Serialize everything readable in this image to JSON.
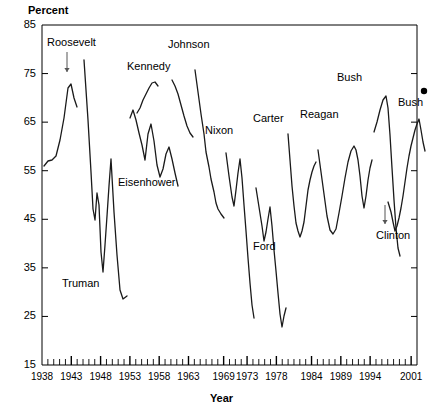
{
  "chart_data": {
    "type": "line",
    "title": "",
    "xlabel": "Year",
    "ylabel": "Percent",
    "ylim": [
      15,
      85
    ],
    "xlim": [
      1938,
      2002
    ],
    "grid": false,
    "legend": "none",
    "ytick_labels": [
      "15",
      "25",
      "35",
      "45",
      "55",
      "65",
      "75",
      "85"
    ],
    "ytick_values": [
      15,
      25,
      35,
      45,
      55,
      65,
      75,
      85
    ],
    "xtick_labels": [
      "1938",
      "1943",
      "1948",
      "1953",
      "1958",
      "1963",
      "1969",
      "1973",
      "1978",
      "1984",
      "1989",
      "1994",
      "2001"
    ],
    "xtick_values": [
      1938,
      1943,
      1948,
      1953,
      1958,
      1963,
      1969,
      1973,
      1978,
      1984,
      1989,
      1994,
      2001
    ],
    "minor_ticks": "annual",
    "annotations": [
      {
        "name": "Roosevelt",
        "label": "Roosevelt",
        "x_px": 47,
        "y_px": 36,
        "arrow": true,
        "arrow_x_px": 67,
        "arrow_y_top_px": 52,
        "arrow_y_bottom_px": 72
      },
      {
        "name": "Truman",
        "label": "Truman",
        "x_px": 62,
        "y_px": 277,
        "arrow": false
      },
      {
        "name": "Eisenhower",
        "label": "Eisenhower",
        "x_px": 118,
        "y_px": 176,
        "arrow": false
      },
      {
        "name": "Kennedy",
        "label": "Kennedy",
        "x_px": 127,
        "y_px": 60,
        "arrow": false
      },
      {
        "name": "Johnson",
        "label": "Johnson",
        "x_px": 168,
        "y_px": 38,
        "arrow": false
      },
      {
        "name": "Nixon",
        "label": "Nixon",
        "x_px": 205,
        "y_px": 124,
        "arrow": false
      },
      {
        "name": "Carter",
        "label": "Carter",
        "x_px": 253,
        "y_px": 112,
        "arrow": false
      },
      {
        "name": "Ford",
        "label": "Ford",
        "x_px": 253,
        "y_px": 240,
        "arrow": false
      },
      {
        "name": "Reagan",
        "label": "Reagan",
        "x_px": 300,
        "y_px": 108,
        "arrow": false
      },
      {
        "name": "Bush-41",
        "label": "Bush",
        "x_px": 337,
        "y_px": 71,
        "arrow": false
      },
      {
        "name": "Clinton",
        "label": "Clinton",
        "x_px": 376,
        "y_px": 229,
        "arrow": true,
        "arrow_x_px": 385,
        "arrow_y_top_px": 205,
        "arrow_y_bottom_px": 224
      },
      {
        "name": "Bush-43",
        "label": "Bush",
        "x_px": 398,
        "y_px": 96,
        "arrow": false
      }
    ],
    "end_marker": {
      "name": "bush-43-point",
      "x_px": 424,
      "y_px": 91,
      "value": 86,
      "year": 2001
    },
    "series": [
      {
        "name": "Roosevelt",
        "points_px": "44,166 48,161 52,160 56,156 60,140 64,118 68,88 71,84 74,98 77,107"
      },
      {
        "name": "Truman",
        "points_px": "84,60 88,120 91,172 93,209 95,220 97,193 99,205 101,252 103,272 105,245 107,216 109,186 111,159 114,212 117,255 120,290 123,299 127,296"
      },
      {
        "name": "Eisenhower",
        "points_px": "130,118 133,110 136,120 139,133 142,145 145,160 148,134 151,124 154,141 157,165 160,177 163,169 166,154 169,147 172,159 175,173 178,186"
      },
      {
        "name": "Kennedy",
        "points_px": "137,113 140,108 143,100 146,94 149,88 152,83 155,82 158,86"
      },
      {
        "name": "Johnson",
        "points_px": "172,80 175,86 178,94 181,105 184,116 187,126 190,133 193,137"
      },
      {
        "name": "Nixon",
        "points_px": "195,70 198,92 201,114 204,134 206,152 209,167 211,179 214,192 216,203 218,209 221,214 224,218"
      },
      {
        "name": "Nixon-2",
        "points_px": "226,153 229,176 232,197 234,206 236,190 238,173 240,159 242,178 244,205 246,231 248,258 250,283 252,305 254,318"
      },
      {
        "name": "Ford",
        "points_px": "256,188 259,207 262,226 264,241 266,232 268,219 270,207 272,226 274,250 276,271 278,293 280,314 282,327 284,316 286,308"
      },
      {
        "name": "Carter",
        "points_px": "288,134 290,160 292,186 294,206 296,223 298,231 300,237 302,231 304,222 306,206 308,190 310,180 312,172 314,166 316,162"
      },
      {
        "name": "Reagan",
        "points_px": "318,150 321,172 324,194 327,216 330,230 333,234 336,229 339,213 342,196 345,178 348,162 351,151 354,146 356,150 358,160 360,176 362,196 364,208 366,196 368,180 370,168 372,160"
      },
      {
        "name": "Bush-41",
        "points_px": "374,132 377,122 380,110 383,100 386,96 388,108 390,135 392,168 394,200 396,228 398,248 400,256"
      },
      {
        "name": "Clinton",
        "points_px": "388,202 391,212 393,222 395,231 397,226 399,218 401,208 403,196 405,182 407,168 409,156 411,146 413,138 415,130 417,124 419,119 421,130 423,142 425,151"
      }
    ]
  },
  "plot_box_px": {
    "left": 42,
    "top": 25,
    "right": 417,
    "bottom": 365
  }
}
